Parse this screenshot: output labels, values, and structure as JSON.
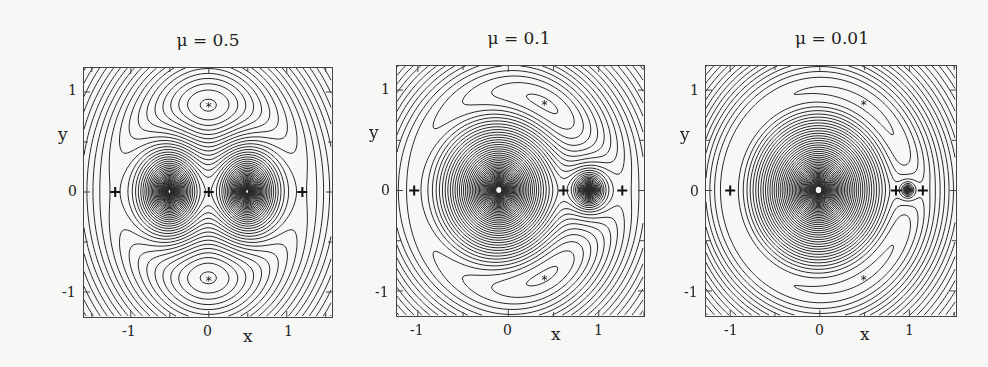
{
  "chart_data": [
    {
      "type": "contour",
      "title": "μ = 0.5",
      "mu": 0.5,
      "xlabel": "x",
      "ylabel": "y",
      "xlim": [
        -1.6,
        1.58
      ],
      "ylim": [
        -1.25,
        1.24
      ],
      "xticks": [
        -1,
        0,
        1
      ],
      "yticks": [
        -1,
        0,
        1
      ],
      "grid": false,
      "markers": {
        "plus": [
          [
            -1.2,
            0
          ],
          [
            0,
            0
          ],
          [
            1.2,
            0
          ]
        ],
        "star": [
          [
            0,
            0.87
          ],
          [
            0,
            -0.87
          ]
        ]
      },
      "frame_px": {
        "left": 83,
        "top": 67,
        "width": 250,
        "height": 251
      }
    },
    {
      "type": "contour",
      "title": "μ = 0.1",
      "mu": 0.1,
      "xlabel": "x",
      "ylabel": "y",
      "xlim": [
        -1.23,
        1.5
      ],
      "ylim": [
        -1.25,
        1.24
      ],
      "xticks": [
        -1,
        0,
        1
      ],
      "yticks": [
        -1,
        0,
        1
      ],
      "grid": false,
      "markers": {
        "plus": [
          [
            -1.04,
            0
          ],
          [
            0.61,
            0
          ],
          [
            1.26,
            0
          ]
        ],
        "star": [
          [
            0.4,
            0.87
          ],
          [
            0.4,
            -0.87
          ]
        ]
      },
      "frame_px": {
        "left": 396,
        "top": 65,
        "width": 249,
        "height": 252
      }
    },
    {
      "type": "contour",
      "title": "μ = 0.01",
      "mu": 0.01,
      "xlabel": "x",
      "ylabel": "y",
      "xlim": [
        -1.27,
        1.52
      ],
      "ylim": [
        -1.25,
        1.24
      ],
      "xticks": [
        -1,
        0,
        1
      ],
      "yticks": [
        -1,
        0,
        1
      ],
      "grid": false,
      "markers": {
        "plus": [
          [
            -1.0,
            0
          ],
          [
            0.85,
            0
          ],
          [
            1.15,
            0
          ]
        ],
        "star": [
          [
            0.49,
            0.87
          ],
          [
            0.49,
            -0.87
          ]
        ]
      },
      "frame_px": {
        "left": 705,
        "top": 65,
        "width": 252,
        "height": 252
      }
    }
  ],
  "panels": [
    {
      "title": "μ = 0.5",
      "xlabel": "x",
      "ylabel": "y",
      "xtick_labels": [
        "-1",
        "0",
        "1"
      ],
      "ytick_labels": [
        "1",
        "0",
        "-1"
      ]
    },
    {
      "title": "μ = 0.1",
      "xlabel": "x",
      "ylabel": "y",
      "xtick_labels": [
        "-1",
        "0",
        "1"
      ],
      "ytick_labels": [
        "1",
        "0",
        "-1"
      ]
    },
    {
      "title": "μ = 0.01",
      "xlabel": "x",
      "ylabel": "y",
      "xtick_labels": [
        "-1",
        "0",
        "1"
      ],
      "ytick_labels": [
        "1",
        "0",
        "-1"
      ]
    }
  ],
  "colors": {
    "line": "#2a2a2a",
    "frame": "#444444",
    "background": "#f7f7f5"
  }
}
